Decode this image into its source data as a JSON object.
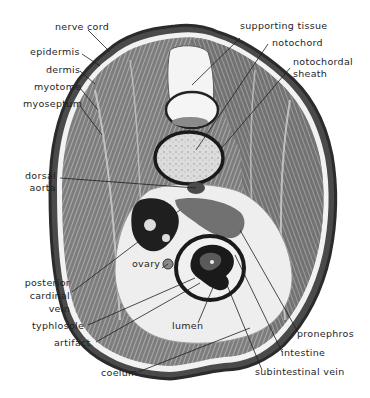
{
  "figure": {
    "colors": {
      "background": "#ffffff",
      "ink": "#1e1e1e",
      "tissue_dark": "#3a3a3a",
      "tissue_mid": "#8a8a8a",
      "tissue_light": "#d9d9d9",
      "coelom": "#efefef"
    }
  },
  "labels": {
    "nerve_cord": "nerve cord",
    "epidermis": "epidermis",
    "dermis": "dermis",
    "myotome": "myotome",
    "myoseptum": "myoseptum",
    "dorsal_aorta_1": "dorsal",
    "dorsal_aorta_2": "aorta",
    "posterior_cardinal_vein_1": "posterior",
    "posterior_cardinal_vein_2": "cardinal",
    "posterior_cardinal_vein_3": "vein",
    "typhlosole": "typhlosole",
    "artifact": "artifact",
    "coelum": "coelum",
    "ovary": "ovary",
    "lumen": "lumen",
    "supporting_tissue": "supporting tissue",
    "notochord": "notochord",
    "notochordal_sheath_1": "notochordal",
    "notochordal_sheath_2": "sheath",
    "pronephros": "pronephros",
    "intestine": "intestine",
    "subintestinal_vein": "subintestinal vein"
  }
}
